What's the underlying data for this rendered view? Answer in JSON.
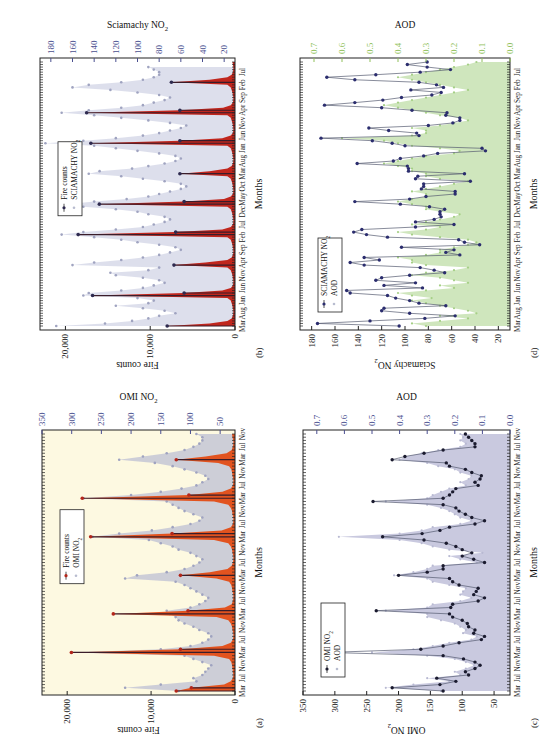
{
  "figure": {
    "orientation": "rotated-90-ccw"
  },
  "chart_data": [
    {
      "id": "a",
      "panel_label": "(a)",
      "type": "area",
      "xlabel": "Months",
      "ylabel": "Fire counts",
      "ylabel_right": "OMI NO2",
      "ylim": [
        0,
        23000
      ],
      "ylim_right": [
        25,
        350
      ],
      "yticks": [
        0,
        10000,
        20000
      ],
      "ytick_labels": [
        "0",
        "10,000",
        "20,000"
      ],
      "yticks_right": [
        50,
        100,
        150,
        200,
        250,
        300,
        350
      ],
      "xtick_labels": [
        "Mar",
        "Jul",
        "Nov",
        "Mar",
        "Jul",
        "Nov",
        "Mar",
        "Jul",
        "Nov",
        "Mar",
        "Jul",
        "Nov",
        "Mar",
        "Jul",
        "Nov",
        "Mar",
        "Jul",
        "Nov",
        "Mar",
        "Jul",
        "Nov"
      ],
      "xtick_every": 4,
      "legend": [
        "Fire counts",
        "OMI NO2"
      ],
      "legend_position": "top-center",
      "colors": {
        "primary": "#e2531f",
        "primary_marker": "#b3261a",
        "secondary": "#c8c9d6",
        "background": "#fdf9e1"
      },
      "series": [
        {
          "name": "Fire counts",
          "axis": "left",
          "style": "filled-spike",
          "values": [
            7000,
            5200,
            1300,
            500,
            250,
            200,
            250,
            300,
            350,
            450,
            700,
            2500,
            19500,
            6500,
            1500,
            500,
            250,
            200,
            200,
            300,
            350,
            500,
            800,
            2200,
            14500,
            5600,
            1200,
            400,
            250,
            200,
            200,
            300,
            350,
            450,
            700,
            2200,
            6500,
            3000,
            900,
            400,
            250,
            200,
            200,
            300,
            350,
            500,
            800,
            2500,
            17200,
            7500,
            1600,
            500,
            250,
            200,
            200,
            300,
            350,
            500,
            800,
            2500,
            18200,
            5500,
            1500,
            500,
            250,
            200,
            200,
            300,
            350,
            450,
            700,
            2000,
            7000,
            3500,
            1000,
            400,
            250,
            200,
            200,
            300,
            350
          ]
        },
        {
          "name": "OMI NO2",
          "axis": "right",
          "style": "points-filled",
          "values": [
            120,
            210,
            150,
            90,
            95,
            80,
            75,
            70,
            65,
            80,
            95,
            110,
            300,
            150,
            100,
            80,
            70,
            65,
            70,
            85,
            95,
            110,
            120,
            125,
            135,
            140,
            100,
            85,
            75,
            70,
            80,
            90,
            100,
            110,
            125,
            210,
            190,
            140,
            110,
            95,
            85,
            80,
            90,
            100,
            120,
            130,
            150,
            170,
            265,
            220,
            165,
            130,
            100,
            85,
            80,
            95,
            110,
            120,
            130,
            140,
            280,
            200,
            150,
            115,
            90,
            80,
            70,
            75,
            90,
            110,
            130,
            160,
            220,
            180,
            140,
            110,
            95,
            85,
            80,
            80,
            90
          ]
        }
      ]
    },
    {
      "id": "b",
      "panel_label": "(b)",
      "type": "area",
      "xlabel": "Months",
      "ylabel": "Fire counts",
      "ylabel_right": "Sciamachy NO2",
      "ylim": [
        0,
        23000
      ],
      "ylim_right": [
        10,
        190
      ],
      "yticks": [
        0,
        10000,
        20000
      ],
      "ytick_labels": [
        "0",
        "10,000",
        "20,000"
      ],
      "yticks_right": [
        20,
        40,
        60,
        80,
        100,
        120,
        140,
        160,
        180
      ],
      "xtick_labels": [
        "Mar",
        "Aug",
        "Jan",
        "Jun",
        "Nov",
        "Apr",
        "Sep",
        "Feb",
        "Jul",
        "Dec",
        "May",
        "Oct",
        "Mar",
        "Aug",
        "Jan",
        "Jun",
        "Nov",
        "Apr",
        "Sep",
        "Feb",
        "Jul",
        "Dec"
      ],
      "xtick_every": 5,
      "legend": [
        "Fire counts",
        "SCIAMACHY NO2"
      ],
      "legend_position": "top-center",
      "colors": {
        "primary": "#c0261d",
        "primary_marker": "#2e2a4f",
        "secondary": "#d9dcea",
        "background": "#ffffff"
      },
      "series": [
        {
          "name": "Fire counts",
          "axis": "left",
          "style": "filled-spike",
          "values": [
            8000,
            3000,
            900,
            400,
            250,
            200,
            200,
            250,
            300,
            400,
            500,
            900,
            16800,
            6000,
            1500,
            500,
            250,
            200,
            200,
            250,
            300,
            400,
            500,
            900,
            7200,
            3500,
            900,
            400,
            250,
            200,
            200,
            250,
            300,
            400,
            500,
            900,
            18500,
            7000,
            1500,
            500,
            250,
            200,
            200,
            250,
            300,
            400,
            500,
            900,
            16000,
            6000,
            1300,
            500,
            250,
            200,
            200,
            250,
            300,
            400,
            500,
            900,
            6500,
            3000,
            900,
            400,
            250,
            200,
            200,
            250,
            300,
            400,
            500,
            900,
            17000,
            6500,
            1500,
            500,
            250,
            200,
            200,
            250,
            300,
            400,
            500,
            900,
            17500,
            6500,
            1400,
            500,
            250,
            200,
            200,
            250,
            300,
            400,
            500,
            900,
            7500,
            3000,
            900,
            400,
            250,
            200,
            200,
            250,
            300
          ]
        },
        {
          "name": "SCIAMACHY NO2",
          "axis": "right",
          "style": "points-hollow",
          "values": [
            175,
            130,
            105,
            90,
            80,
            65,
            75,
            95,
            120,
            90,
            85,
            100,
            150,
            145,
            115,
            95,
            85,
            75,
            80,
            95,
            120,
            125,
            90,
            80,
            160,
            140,
            115,
            95,
            80,
            70,
            60,
            65,
            80,
            100,
            115,
            140,
            170,
            150,
            120,
            95,
            85,
            75,
            70,
            75,
            90,
            100,
            120,
            150,
            165,
            140,
            110,
            90,
            80,
            70,
            60,
            55,
            60,
            75,
            95,
            115,
            145,
            135,
            105,
            90,
            75,
            65,
            60,
            65,
            80,
            100,
            120,
            140,
            185,
            150,
            120,
            95,
            80,
            70,
            60,
            55,
            70,
            90,
            115,
            140,
            170,
            145,
            115,
            95,
            85,
            75,
            70,
            80,
            100,
            125,
            160,
            145,
            115,
            95,
            85,
            80,
            80,
            85,
            90
          ]
        }
      ]
    },
    {
      "id": "c",
      "panel_label": "(c)",
      "type": "line",
      "xlabel": "Months",
      "ylabel": "OMI NO2",
      "ylabel_right": "AOD",
      "ylim": [
        25,
        350
      ],
      "ylim_right": [
        0.0,
        0.75
      ],
      "yticks": [
        50,
        100,
        150,
        200,
        250,
        300,
        350
      ],
      "yticks_right": [
        0.0,
        0.1,
        0.2,
        0.3,
        0.4,
        0.5,
        0.6,
        0.7
      ],
      "ytick_labels_right": [
        "0.0",
        "0.1",
        "0.2",
        "0.3",
        "0.4",
        "0.5",
        "0.6",
        "0.7"
      ],
      "xtick_labels": [
        "Mar",
        "Jul",
        "Nov",
        "Mar",
        "Jul",
        "Nov",
        "Mar",
        "Jul",
        "Nov",
        "Mar",
        "Jul",
        "Nov",
        "Mar",
        "Jul",
        "Nov",
        "Mar",
        "Jul",
        "Nov",
        "Mar",
        "Jul",
        "Nov"
      ],
      "xtick_every": 4,
      "legend": [
        "OMI NO2",
        "AOD"
      ],
      "legend_position": "top-left",
      "colors": {
        "primary": "#1a1a2e",
        "secondary": "#c9c9df",
        "background": "#ffffff"
      },
      "series": [
        {
          "name": "OMI NO2",
          "axis": "left",
          "style": "line-markers",
          "values": [
            130,
            210,
            135,
            110,
            140,
            90,
            95,
            80,
            72,
            80,
            98,
            130,
            310,
            165,
            130,
            105,
            70,
            65,
            82,
            80,
            90,
            92,
            100,
            115,
            120,
            235,
            118,
            115,
            75,
            65,
            82,
            78,
            75,
            105,
            115,
            120,
            200,
            155,
            130,
            130,
            65,
            82,
            100,
            85,
            100,
            110,
            125,
            160,
            225,
            163,
            135,
            120,
            80,
            65,
            85,
            95,
            105,
            110,
            130,
            240,
            130,
            120,
            115,
            110,
            75,
            80,
            72,
            70,
            85,
            95,
            120,
            125,
            210,
            190,
            160,
            130,
            80,
            80,
            85,
            90,
            95
          ]
        },
        {
          "name": "AOD",
          "axis": "right",
          "style": "filled-area",
          "values": [
            0.25,
            0.45,
            0.35,
            0.22,
            0.3,
            0.18,
            0.2,
            0.16,
            0.13,
            0.16,
            0.2,
            0.3,
            0.5,
            0.35,
            0.28,
            0.22,
            0.14,
            0.12,
            0.17,
            0.16,
            0.18,
            0.2,
            0.25,
            0.3,
            0.3,
            0.45,
            0.3,
            0.28,
            0.18,
            0.14,
            0.18,
            0.17,
            0.16,
            0.22,
            0.28,
            0.3,
            0.42,
            0.35,
            0.3,
            0.28,
            0.12,
            0.18,
            0.22,
            0.1,
            0.22,
            0.28,
            0.32,
            0.4,
            0.62,
            0.4,
            0.32,
            0.28,
            0.18,
            0.14,
            0.18,
            0.2,
            0.22,
            0.25,
            0.3,
            0.45,
            0.3,
            0.28,
            0.25,
            0.22,
            0.16,
            0.18,
            0.15,
            0.14,
            0.18,
            0.2,
            0.26,
            0.3,
            0.4,
            0.38,
            0.32,
            0.26,
            0.18,
            0.16,
            0.18,
            0.17,
            0.18
          ]
        }
      ]
    },
    {
      "id": "d",
      "panel_label": "(d)",
      "type": "line",
      "xlabel": "Months",
      "ylabel": "Sciamachy NO2",
      "ylabel_right": "AOD",
      "ylim": [
        10,
        190
      ],
      "ylim_right": [
        0.0,
        0.75
      ],
      "yticks": [
        20,
        40,
        60,
        80,
        100,
        120,
        140,
        160,
        180
      ],
      "yticks_right": [
        0.0,
        0.1,
        0.2,
        0.3,
        0.4,
        0.5,
        0.6,
        0.7
      ],
      "ytick_labels_right": [
        "0.0",
        "0.1",
        "0.2",
        "0.3",
        "0.4",
        "0.5",
        "0.6",
        "0.7"
      ],
      "xtick_labels": [
        "Mar",
        "Aug",
        "Jan",
        "Jun",
        "Nov",
        "Apr",
        "Sep",
        "Feb",
        "Jul",
        "Dec",
        "May",
        "Oct",
        "Mar",
        "Aug",
        "Jan",
        "Jun",
        "Nov",
        "Apr",
        "Sep",
        "Feb",
        "Jul",
        "Dec"
      ],
      "xtick_every": 5,
      "legend": [
        "SCIAMACHY NO2",
        "AOD"
      ],
      "legend_position": "top-left",
      "colors": {
        "primary": "#2b2d6e",
        "secondary": "#cfe6bd",
        "secondary_axis": "#8fbf5a",
        "background": "#ffffff"
      },
      "series": [
        {
          "name": "SCIAMACHY NO2",
          "axis": "left",
          "style": "line-markers",
          "values": [
            105,
            175,
            130,
            83,
            57,
            96,
            120,
            118,
            65,
            88,
            96,
            108,
            115,
            147,
            150,
            85,
            118,
            91,
            125,
            120,
            96,
            66,
            75,
            87,
            135,
            147,
            122,
            135,
            53,
            65,
            58,
            103,
            36,
            49,
            54,
            115,
            133,
            144,
            137,
            91,
            58,
            91,
            75,
            69,
            70,
            70,
            66,
            79,
            104,
            143,
            96,
            82,
            57,
            57,
            86,
            84,
            84,
            44,
            91,
            89,
            49,
            97,
            97,
            98,
            141,
            110,
            104,
            84,
            72,
            31,
            34,
            100,
            111,
            128,
            172,
            88,
            90,
            114,
            131,
            80,
            59,
            53,
            53,
            65,
            64,
            94,
            120,
            169,
            143,
            119,
            103,
            77,
            69,
            95,
            67,
            73,
            88,
            143,
            167,
            125,
            87,
            61,
            81,
            98,
            81
          ]
        },
        {
          "name": "AOD",
          "axis": "right",
          "style": "filled-area",
          "values": [
            0.3,
            0.35,
            0.25,
            0.15,
            0.25,
            0.12,
            0.15,
            0.2,
            0.25,
            0.3,
            0.35,
            0.28,
            0.35,
            0.4,
            0.3,
            0.2,
            0.25,
            0.15,
            0.2,
            0.25,
            0.35,
            0.3,
            0.2,
            0.15,
            0.3,
            0.35,
            0.35,
            0.4,
            0.3,
            0.25,
            0.25,
            0.2,
            0.15,
            0.12,
            0.15,
            0.25,
            0.35,
            0.4,
            0.3,
            0.25,
            0.35,
            0.3,
            0.25,
            0.2,
            0.18,
            0.25,
            0.3,
            0.3,
            0.35,
            0.4,
            0.35,
            0.3,
            0.3,
            0.35,
            0.3,
            0.25,
            0.2,
            0.15,
            0.25,
            0.3,
            0.3,
            0.35,
            0.35,
            0.4,
            0.45,
            0.4,
            0.35,
            0.3,
            0.2,
            0.18,
            0.25,
            0.35,
            0.4,
            0.45,
            0.6,
            0.35,
            0.3,
            0.3,
            0.35,
            0.25,
            0.2,
            0.15,
            0.18,
            0.25,
            0.3,
            0.35,
            0.4,
            0.45,
            0.4,
            0.35,
            0.3,
            0.25,
            0.2,
            0.15,
            0.2,
            0.25,
            0.3,
            0.35,
            0.4,
            0.35,
            0.3,
            0.25,
            0.2,
            0.15,
            0.12
          ]
        }
      ]
    }
  ]
}
